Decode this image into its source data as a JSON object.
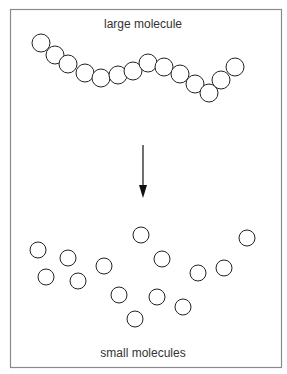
{
  "diagram": {
    "top_label": "large molecule",
    "bottom_label": "small molecules",
    "frame": {
      "x": 10.5,
      "y": 9.5,
      "width": 271,
      "height": 358,
      "stroke": "#8a8a8a"
    },
    "circle_stroke": "#222222",
    "large_molecule": {
      "radius": 9,
      "circles": [
        [
          41,
          43
        ],
        [
          55,
          55
        ],
        [
          68,
          64
        ],
        [
          85,
          73
        ],
        [
          101,
          78
        ],
        [
          118,
          75
        ],
        [
          133,
          71
        ],
        [
          148,
          63
        ],
        [
          164,
          67
        ],
        [
          180,
          74
        ],
        [
          195,
          84
        ],
        [
          209,
          93
        ],
        [
          221,
          80
        ],
        [
          235,
          67
        ]
      ]
    },
    "arrow": {
      "x": 143,
      "y1": 145,
      "y2": 198,
      "color": "#111111"
    },
    "small_molecules": {
      "radius": 8,
      "circles": [
        [
          38,
          250
        ],
        [
          68,
          258
        ],
        [
          46,
          277
        ],
        [
          78,
          281
        ],
        [
          104,
          266
        ],
        [
          141,
          235
        ],
        [
          162,
          259
        ],
        [
          119,
          295
        ],
        [
          157,
          297
        ],
        [
          135,
          319
        ],
        [
          183,
          307
        ],
        [
          198,
          273
        ],
        [
          224,
          268
        ],
        [
          247,
          238
        ]
      ]
    }
  }
}
